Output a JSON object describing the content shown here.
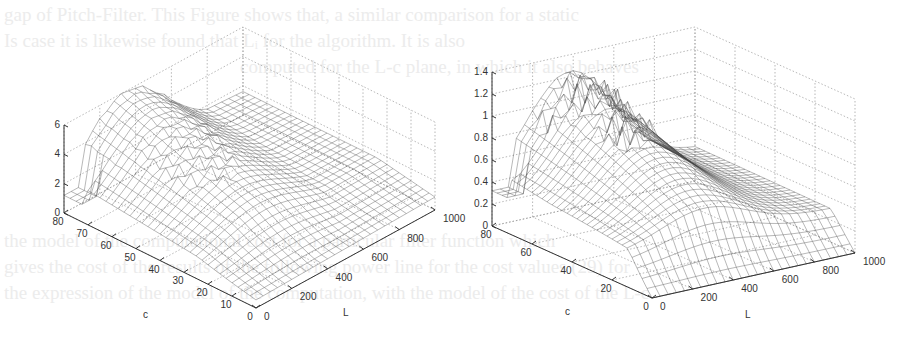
{
  "bleed_through_text": [
    "gap of Pitch-Filter. This Figure shows that, a similar comparison for a static",
    "Is case it is likewise found that Lᵢ for the algorithm. It is also",
    "computed for the L-c plane, in which it also behaves",
    "",
    "",
    "the model of the computational cost for a particular filter function which",
    "gives the cost of the results of the following power line for the cost values (29) for",
    "the expression of the model of the computation, with the model of the cost of the L-c"
  ],
  "chart_data": [
    {
      "type": "surface",
      "title": "",
      "xlabel": "c",
      "ylabel": "L",
      "zlabel": "",
      "x_ticks": [
        0,
        10,
        20,
        30,
        40,
        50,
        60,
        70,
        80
      ],
      "y_ticks": [
        0,
        200,
        400,
        600,
        800,
        1000
      ],
      "z_ticks": [
        0,
        2,
        4,
        6
      ],
      "xlim": [
        0,
        80
      ],
      "ylim": [
        0,
        1000
      ],
      "zlim": [
        0,
        6
      ],
      "grid": true,
      "description": "Wireframe mesh; surface rises from ~1 at L=0 to a ridge peak of ~6 near c=80, L≈300-400; a sharp valley/fold near c≈20, L≈300; surface falls toward ~1-2 at L=1000; low step ~1 near c=80, L=0-100"
    },
    {
      "type": "surface",
      "title": "",
      "xlabel": "c",
      "ylabel": "L",
      "zlabel": "",
      "x_ticks": [
        0,
        20,
        40,
        60,
        80
      ],
      "y_ticks": [
        0,
        200,
        400,
        600,
        800,
        1000
      ],
      "z_ticks": [
        0,
        0.2,
        0.4,
        0.6,
        0.8,
        1,
        1.2,
        1.4
      ],
      "xlim": [
        0,
        80
      ],
      "ylim": [
        0,
        1000
      ],
      "zlim": [
        0,
        1.4
      ],
      "grid": true,
      "description": "Wireframe mesh; ridge of ~1.2-1.3 near c=60-80, L≈300-500 with jagged peaks; drops to ~0 along c≈0-10 near L≈300; falls to ~0.3 at L=1000; low step ~0.3 near c=80, L=0-100"
    }
  ],
  "plots": [
    {
      "id": "left",
      "z_ticks": [
        "0",
        "2",
        "4",
        "6"
      ],
      "c_ticks": [
        "80",
        "70",
        "60",
        "50",
        "40",
        "30",
        "20",
        "10",
        "0"
      ],
      "L_ticks": [
        "0",
        "200",
        "400",
        "600",
        "800",
        "1000"
      ],
      "c_label": "c",
      "L_label": "L"
    },
    {
      "id": "right",
      "z_ticks": [
        "0",
        "0.2",
        "0.4",
        "0.6",
        "0.8",
        "1",
        "1.2",
        "1.4"
      ],
      "c_ticks": [
        "80",
        "60",
        "40",
        "20",
        "0"
      ],
      "L_ticks": [
        "0",
        "200",
        "400",
        "600",
        "800",
        "1000"
      ],
      "c_label": "c",
      "L_label": "L"
    }
  ]
}
